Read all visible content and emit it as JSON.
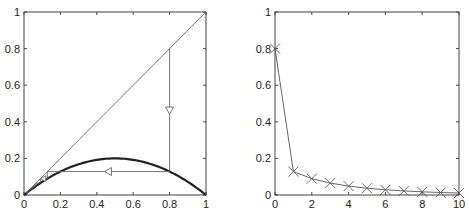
{
  "chart_data": [
    {
      "type": "line",
      "title": "",
      "xlabel": "",
      "ylabel": "",
      "xlim": [
        0,
        1
      ],
      "ylim": [
        0,
        1
      ],
      "grid": false,
      "xticks": [
        "0",
        "0.2",
        "0.4",
        "0.6",
        "0.8",
        "1"
      ],
      "yticks": [
        "0",
        "0.2",
        "0.4",
        "0.6",
        "0.8",
        "1"
      ],
      "series": [
        {
          "name": "diagonal y=x",
          "x": [
            0,
            1
          ],
          "y": [
            0,
            1
          ]
        },
        {
          "name": "map f(x)=0.8x(1-x)",
          "function": "0.8*x*(1-x)",
          "x_range": [
            0,
            1
          ]
        },
        {
          "name": "cobweb",
          "x0": 0.8,
          "iterations": [
            0.8,
            0.128,
            0.0893,
            0.0651,
            0.0487,
            0.037,
            0.0285,
            0.0222,
            0.0173,
            0.0136,
            0.0108
          ]
        }
      ],
      "colors": {
        "diagonal": "#777777",
        "map": "#222222",
        "cobweb": "#666666"
      }
    },
    {
      "type": "line",
      "title": "",
      "xlabel": "",
      "ylabel": "",
      "xlim": [
        0,
        10
      ],
      "ylim": [
        0,
        1
      ],
      "grid": false,
      "xticks": [
        "0",
        "2",
        "4",
        "6",
        "8",
        "10"
      ],
      "yticks": [
        "0",
        "0.2",
        "0.4",
        "0.6",
        "0.8",
        "1"
      ],
      "series": [
        {
          "name": "x_n",
          "marker": "x",
          "x": [
            0,
            1,
            2,
            3,
            4,
            5,
            6,
            7,
            8,
            9,
            10
          ],
          "y": [
            0.8,
            0.128,
            0.0893,
            0.0651,
            0.0487,
            0.037,
            0.0285,
            0.0222,
            0.0173,
            0.0136,
            0.0108
          ]
        }
      ],
      "colors": {
        "line": "#555555",
        "marker": "#555555"
      }
    }
  ]
}
